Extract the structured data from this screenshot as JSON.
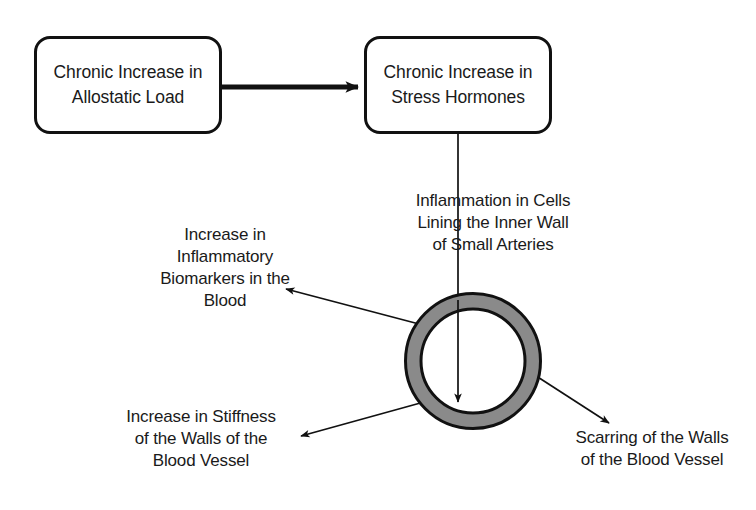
{
  "diagram": {
    "colors": {
      "stroke": "#111111",
      "text": "#1a1a1a",
      "vessel_wall_fill": "#8a8a8a",
      "vessel_lumen_fill": "#ffffff",
      "background": "#ffffff"
    },
    "nodes": {
      "allostatic_load": {
        "lines": [
          "Chronic Increase in",
          "Allostatic Load"
        ],
        "line1": "Chronic Increase in",
        "line2": "Allostatic Load"
      },
      "stress_hormones": {
        "lines": [
          "Chronic Increase in",
          "Stress Hormones"
        ],
        "line1": "Chronic Increase in",
        "line2": "Stress Hormones"
      }
    },
    "labels": {
      "inflammation_cells": {
        "line1": "Inflammation in Cells",
        "line2": "Lining the Inner Wall",
        "line3": "of Small Arteries"
      },
      "inflammatory_biomarkers": {
        "line1": "Increase in",
        "line2": "Inflammatory",
        "line3": "Biomarkers in the",
        "line4": "Blood"
      },
      "stiffness_walls": {
        "line1": "Increase in Stiffness",
        "line2": "of the Walls of the",
        "line3": "Blood Vessel"
      },
      "scarring_walls": {
        "line1": "Scarring of the Walls",
        "line2": "of the Blood Vessel"
      }
    },
    "shapes": {
      "blood_vessel_cross_section": {
        "name": "blood-vessel-ring",
        "center_x": 473,
        "center_y": 361,
        "outer_radius": 69,
        "inner_radius": 53
      }
    },
    "connectors": [
      {
        "name": "allostatic-to-hormones",
        "from": "allostatic_load",
        "to": "stress_hormones",
        "style": "thick-arrow"
      },
      {
        "name": "hormones-to-vessel",
        "from": "stress_hormones",
        "to": "blood_vessel_cross_section",
        "style": "thin-arrow"
      },
      {
        "name": "vessel-to-inflammatory-biomarkers",
        "from": "blood_vessel_cross_section",
        "to": "inflammatory_biomarkers",
        "style": "thin-arrow"
      },
      {
        "name": "vessel-to-stiffness",
        "from": "blood_vessel_cross_section",
        "to": "stiffness_walls",
        "style": "thin-arrow"
      },
      {
        "name": "vessel-to-scarring",
        "from": "blood_vessel_cross_section",
        "to": "scarring_walls",
        "style": "thin-arrow"
      }
    ]
  }
}
